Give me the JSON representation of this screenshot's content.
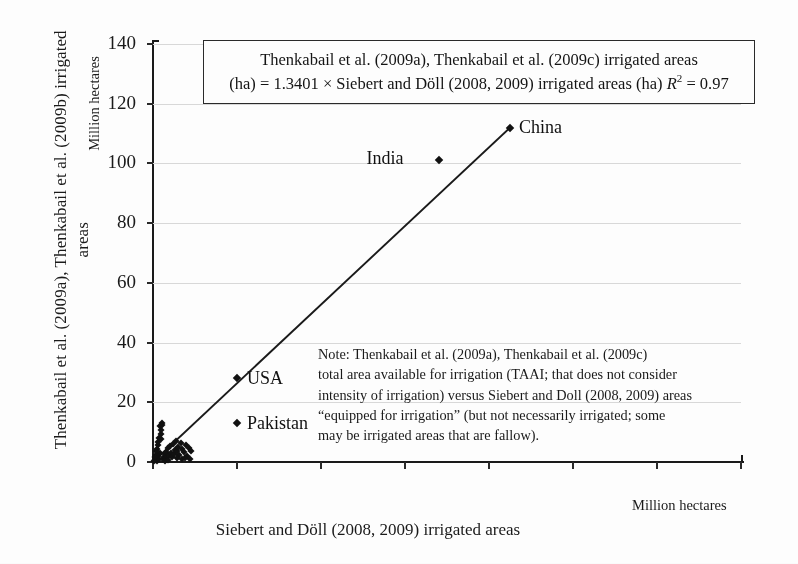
{
  "chart_data": {
    "type": "scatter",
    "title": "",
    "xlabel": "Siebert and Döll (2008, 2009) irrigated areas",
    "ylabel": "Thenkabail et al. (2009a), Thenkabail et al. (2009b) irrigated areas",
    "x_units": "Million hectares",
    "y_units": "Million hectares",
    "xlim": [
      0,
      140
    ],
    "ylim": [
      0,
      140
    ],
    "xticks": [
      0,
      20,
      40,
      60,
      80,
      100,
      120,
      140
    ],
    "yticks": [
      0,
      20,
      40,
      60,
      80,
      100,
      120,
      140
    ],
    "grid": "horizontal",
    "legend": "none",
    "equation": {
      "line1": "Thenkabail et al. (2009a), Thenkabail et al. (2009c) irrigated areas",
      "line2_pre": "(ha) = 1.3401 × Siebert and Döll (2008, 2009) irrigated areas (ha) ",
      "r_symbol": "R",
      "r_exponent": "2",
      "r_value": " = 0.97",
      "slope": 1.3401,
      "r_squared": 0.97
    },
    "trendline": {
      "slope": 1.3401,
      "intercept": 0,
      "x_start": 0,
      "x_end": 85,
      "y_start": 0,
      "y_end": 112
    },
    "labeled_points": [
      {
        "name": "China",
        "x": 85,
        "y": 112,
        "label_dx": 9,
        "label_dy": -11
      },
      {
        "name": "India",
        "x": 68,
        "y": 101,
        "label_dx": -72,
        "label_dy": -12
      },
      {
        "name": "USA",
        "x": 20,
        "y": 28,
        "label_dx": 10,
        "label_dy": -10
      },
      {
        "name": "Pakistan",
        "x": 20,
        "y": 13,
        "label_dx": 10,
        "label_dy": -10
      }
    ],
    "cluster_points": [
      {
        "x": 0.5,
        "y": 0.6
      },
      {
        "x": 0.8,
        "y": 1.2
      },
      {
        "x": 1.0,
        "y": 0.4
      },
      {
        "x": 1.2,
        "y": 2.0
      },
      {
        "x": 1.4,
        "y": 1.0
      },
      {
        "x": 1.6,
        "y": 3.1
      },
      {
        "x": 0.6,
        "y": 2.5
      },
      {
        "x": 0.9,
        "y": 4.2
      },
      {
        "x": 1.1,
        "y": 5.6
      },
      {
        "x": 1.3,
        "y": 6.8
      },
      {
        "x": 1.5,
        "y": 8.1
      },
      {
        "x": 1.8,
        "y": 9.4
      },
      {
        "x": 2.0,
        "y": 10.6
      },
      {
        "x": 1.7,
        "y": 11.9
      },
      {
        "x": 2.2,
        "y": 13.0
      },
      {
        "x": 2.4,
        "y": 0.9
      },
      {
        "x": 2.6,
        "y": 1.8
      },
      {
        "x": 2.8,
        "y": 2.6
      },
      {
        "x": 3.0,
        "y": 3.4
      },
      {
        "x": 3.2,
        "y": 1.4
      },
      {
        "x": 3.5,
        "y": 4.6
      },
      {
        "x": 3.8,
        "y": 2.2
      },
      {
        "x": 4.0,
        "y": 5.3
      },
      {
        "x": 4.2,
        "y": 3.0
      },
      {
        "x": 4.5,
        "y": 1.6
      },
      {
        "x": 4.8,
        "y": 6.1
      },
      {
        "x": 5.0,
        "y": 2.8
      },
      {
        "x": 5.2,
        "y": 4.0
      },
      {
        "x": 5.5,
        "y": 7.0
      },
      {
        "x": 5.8,
        "y": 3.6
      },
      {
        "x": 6.0,
        "y": 5.0
      },
      {
        "x": 6.3,
        "y": 2.4
      },
      {
        "x": 6.6,
        "y": 6.4
      },
      {
        "x": 7.0,
        "y": 4.4
      },
      {
        "x": 7.4,
        "y": 3.2
      },
      {
        "x": 7.8,
        "y": 5.8
      },
      {
        "x": 8.2,
        "y": 2.0
      },
      {
        "x": 8.6,
        "y": 4.8
      },
      {
        "x": 9.0,
        "y": 3.8
      },
      {
        "x": 0.3,
        "y": 0.2
      },
      {
        "x": 0.4,
        "y": 1.6
      },
      {
        "x": 0.7,
        "y": 3.6
      },
      {
        "x": 1.9,
        "y": 7.6
      },
      {
        "x": 2.1,
        "y": 12.3
      },
      {
        "x": 2.9,
        "y": 0.5
      },
      {
        "x": 3.6,
        "y": 0.8
      },
      {
        "x": 5.6,
        "y": 1.2
      },
      {
        "x": 6.8,
        "y": 1.0
      },
      {
        "x": 7.6,
        "y": 1.5
      },
      {
        "x": 8.8,
        "y": 1.1
      }
    ]
  },
  "note": {
    "lines": [
      "Note: Thenkabail et al. (2009a), Thenkabail et al. (2009c)",
      "total area available for irrigation (TAAI; that does not consider",
      "intensity of irrigation) versus Siebert and Doll (2008, 2009) areas",
      "“equipped for irrigation” (but not necessarily irrigated; some",
      "may be irrigated areas that are fallow)."
    ]
  },
  "colors": {
    "background": "#ffffff",
    "axis": "#1a1a1a",
    "grid": "#d8d8d8",
    "marker": "#111111",
    "trendline": "#1a1a1a",
    "box_border": "#2a2a2a"
  }
}
